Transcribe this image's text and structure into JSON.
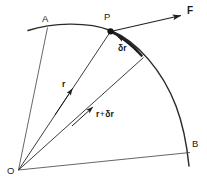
{
  "figure": {
    "background_color": "#ffffff",
    "stroke_color": "#2b2b2b",
    "text_color": "#1a1a1a",
    "width": 207,
    "height": 183
  },
  "labels": {
    "point_a": "A",
    "point_p": "P",
    "point_b": "B",
    "point_o": "O",
    "force": "F",
    "radius": "r",
    "delta_r": "δr",
    "delta_r_greek": "δ",
    "delta_r_latin": "r",
    "r_plus_delta_r_first": "r",
    "r_plus_delta_r_op": "+",
    "r_plus_delta_r_second_greek": "δ",
    "r_plus_delta_r_second_latin": "r"
  },
  "elements": {
    "arc_path": "curved trajectory from A through P down to B",
    "force_vector": "arrow from P pointing up-right labelled F",
    "radius_vector": "arrow from O to P labelled r",
    "radius_plus_delta_vector": "arrow from O to point on arc labelled r + δr",
    "delta_r_arc": "thickened arc segment from P to neighbouring point labelled δr",
    "chord_oa": "straight line from O to A",
    "chord_ob": "straight line from O to B",
    "point_marker_p": "filled dot at P"
  }
}
